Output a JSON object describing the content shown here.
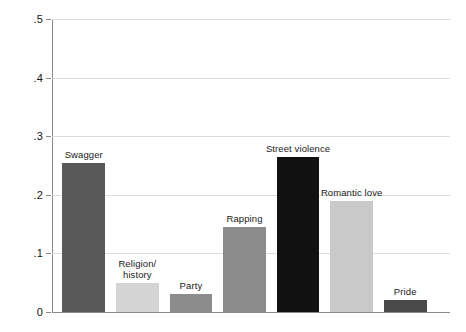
{
  "chart_data": {
    "type": "bar",
    "title": "",
    "subtitle": "",
    "xlabel": "",
    "ylabel": "",
    "ylim": [
      0,
      0.5
    ],
    "xlim": [
      0,
      1
    ],
    "grid": true,
    "legend": false,
    "legend_position": "none",
    "y_tick_labels": [
      "0",
      ".1",
      ".2",
      ".3",
      ".4",
      ".5"
    ],
    "y_tick_values": [
      0,
      0.1,
      0.2,
      0.3,
      0.4,
      0.5
    ],
    "categories": [
      "Swagger",
      "Religion/ history",
      "Party",
      "Rapping",
      "Street violence",
      "Romantic love",
      "Pride"
    ],
    "values": [
      0.255,
      0.05,
      0.03,
      0.145,
      0.265,
      0.19,
      0.02
    ],
    "bar_colors": [
      "#595959",
      "#d4d4d4",
      "#8c8c8c",
      "#8c8c8c",
      "#111111",
      "#c9c9c9",
      "#4a4a4a"
    ],
    "annotations": [
      {
        "label": "Swagger",
        "value": 0.255
      },
      {
        "label": "Religion/ history",
        "value": 0.05
      },
      {
        "label": "Party",
        "value": 0.03
      },
      {
        "label": "Rapping",
        "value": 0.145
      },
      {
        "label": "Street violence",
        "value": 0.265
      },
      {
        "label": "Romantic love",
        "value": 0.19
      },
      {
        "label": "Pride",
        "value": 0.02
      }
    ]
  },
  "bars": [
    {
      "label_line1": "Swagger",
      "label_line2": ""
    },
    {
      "label_line1": "Religion/",
      "label_line2": "history"
    },
    {
      "label_line1": "Party",
      "label_line2": ""
    },
    {
      "label_line1": "Rapping",
      "label_line2": ""
    },
    {
      "label_line1": "Street violence",
      "label_line2": ""
    },
    {
      "label_line1": "Romantic love",
      "label_line2": ""
    },
    {
      "label_line1": "Pride",
      "label_line2": ""
    }
  ],
  "axis": {
    "t0": "0",
    "t1": ".1",
    "t2": ".2",
    "t3": ".3",
    "t4": ".4",
    "t5": ".5"
  },
  "colors": {
    "grid": "#dcdcdc",
    "axis": "#8a8a8a",
    "text": "#141414",
    "background": "#ffffff"
  }
}
